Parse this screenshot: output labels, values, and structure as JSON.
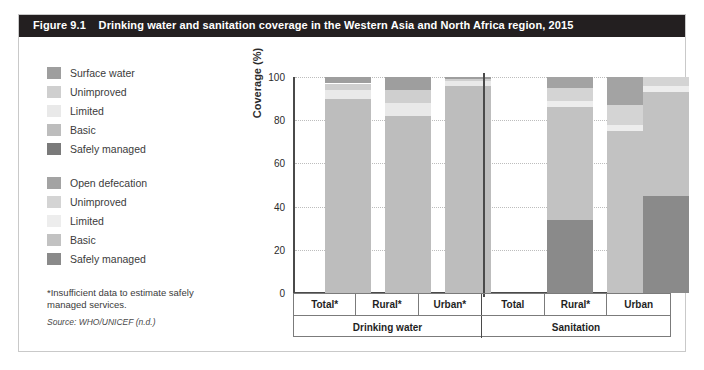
{
  "figure": {
    "number": "Figure 9.1",
    "title": "Drinking water and sanitation coverage in the Western Asia and North Africa region, 2015",
    "footnote": "*Insufficient data to estimate safely managed services.",
    "source": "Source: WHO/UNICEF (n.d.)"
  },
  "legends": [
    {
      "id": "drinking-water",
      "items": [
        {
          "label": "Surface water",
          "color": "#9e9e9e"
        },
        {
          "label": "Unimproved",
          "color": "#cfcfcf"
        },
        {
          "label": "Limited",
          "color": "#e9e9e9"
        },
        {
          "label": "Basic",
          "color": "#bdbdbd"
        },
        {
          "label": "Safely managed",
          "color": "#7a7a7a"
        }
      ]
    },
    {
      "id": "sanitation",
      "items": [
        {
          "label": "Open defecation",
          "color": "#a3a3a3"
        },
        {
          "label": "Unimproved",
          "color": "#d4d4d4"
        },
        {
          "label": "Limited",
          "color": "#ededed"
        },
        {
          "label": "Basic",
          "color": "#c2c2c2"
        },
        {
          "label": "Safely managed",
          "color": "#8a8a8a"
        }
      ]
    }
  ],
  "axis": {
    "ylabel": "Coverage (%)",
    "yticks": [
      "0",
      "20",
      "40",
      "60",
      "80",
      "100"
    ]
  },
  "groups": [
    {
      "label": "Drinking water",
      "categories": [
        "Total*",
        "Rural*",
        "Urban*"
      ]
    },
    {
      "label": "Sanitation",
      "categories": [
        "Total",
        "Rural*",
        "Urban"
      ]
    }
  ],
  "chart_data": {
    "type": "bar",
    "title": "Drinking water and sanitation coverage in the Western Asia and North Africa region, 2015",
    "xlabel": "",
    "ylabel": "Coverage (%)",
    "ylim": [
      0,
      100
    ],
    "yticks": [
      0,
      20,
      40,
      60,
      80,
      100
    ],
    "grid": true,
    "stacked": true,
    "legend_position": "left",
    "groups": [
      "Drinking water",
      "Sanitation"
    ],
    "categories": [
      "Total*",
      "Rural*",
      "Urban*",
      "Total",
      "Rural*",
      "Urban"
    ],
    "series": [
      {
        "name": "Safely managed",
        "values": [
          0,
          0,
          0,
          34,
          0,
          45
        ],
        "colors": [
          "#7a7a7a",
          "#7a7a7a",
          "#7a7a7a",
          "#8a8a8a",
          "#8a8a8a",
          "#8a8a8a"
        ]
      },
      {
        "name": "Basic",
        "values": [
          90,
          82,
          96,
          52,
          75,
          48
        ],
        "colors": [
          "#bdbdbd",
          "#bdbdbd",
          "#bdbdbd",
          "#c2c2c2",
          "#c2c2c2",
          "#c2c2c2"
        ]
      },
      {
        "name": "Limited",
        "values": [
          4,
          6,
          2,
          3,
          3,
          3
        ],
        "colors": [
          "#e9e9e9",
          "#e9e9e9",
          "#e9e9e9",
          "#ededed",
          "#ededed",
          "#ededed"
        ]
      },
      {
        "name": "Unimproved",
        "values": [
          3,
          6,
          1,
          6,
          9,
          4
        ],
        "colors": [
          "#cfcfcf",
          "#cfcfcf",
          "#cfcfcf",
          "#d4d4d4",
          "#d4d4d4",
          "#d4d4d4"
        ]
      },
      {
        "name": "Surface water / Open defecation",
        "values": [
          3,
          6,
          1,
          5,
          13,
          0
        ],
        "colors": [
          "#9e9e9e",
          "#9e9e9e",
          "#9e9e9e",
          "#a3a3a3",
          "#a3a3a3",
          "#a3a3a3"
        ]
      }
    ]
  }
}
